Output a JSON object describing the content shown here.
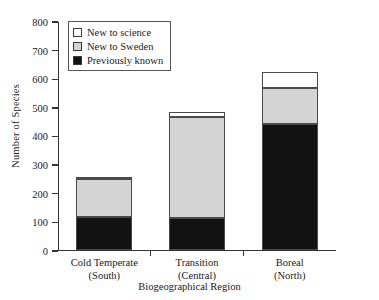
{
  "chart_data": {
    "type": "bar",
    "subtype": "stacked",
    "title": "",
    "xlabel": "Biogeographical Region",
    "ylabel": "Number of Species",
    "categories": [
      "Cold Temperate\n(South)",
      "Transition\n(Central)",
      "Boreal\n(North)"
    ],
    "category_lines": [
      [
        "Cold Temperate",
        "(South)"
      ],
      [
        "Transition",
        "(Central)"
      ],
      [
        "Boreal",
        "(North)"
      ]
    ],
    "series": [
      {
        "name": "Previously known",
        "color": "#121212",
        "values": [
          115,
          112,
          440
        ]
      },
      {
        "name": "New to Sweden",
        "color": "#d4d4d4",
        "values": [
          131,
          351,
          125
        ]
      },
      {
        "name": "New to science",
        "color": "#ffffff",
        "values": [
          2,
          17,
          55
        ]
      }
    ],
    "totals": [
      248,
      480,
      620
    ],
    "ylim": [
      0,
      800
    ],
    "ytick_values": [
      0,
      100,
      200,
      300,
      400,
      500,
      600,
      700,
      800
    ],
    "ytick_labels": [
      "0",
      "100",
      "200",
      "300",
      "400",
      "500",
      "600",
      "700",
      "800"
    ],
    "grid": false,
    "legend_position": "upper-left-inside",
    "legend_entries": [
      "New to science",
      "New to Sweden",
      "Previously known"
    ]
  },
  "legend": {
    "items": [
      {
        "label": "New to science",
        "color": "#ffffff"
      },
      {
        "label": "New to Sweden",
        "color": "#d4d4d4"
      },
      {
        "label": "Previously known",
        "color": "#121212"
      }
    ]
  },
  "axes": {
    "y_title": "Number of Species",
    "x_title": "Biogeographical Region"
  }
}
